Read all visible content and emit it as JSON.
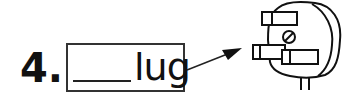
{
  "item": {
    "number": "4.",
    "word_suffix": "lug",
    "blank": "____",
    "picture": "plug-icon"
  }
}
